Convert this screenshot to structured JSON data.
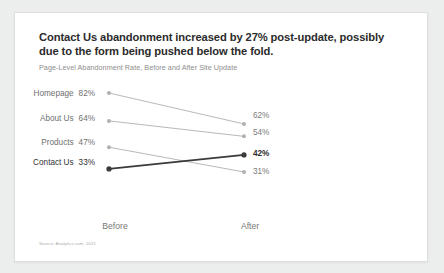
{
  "card": {
    "title": "Contact Us abandonment increased by 27% post-update, possibly due to the form being pushed below the fold.",
    "subtitle": "Page-Level Abandonment Rate, Before and After Site Update",
    "source": "Source: Analytics.com, 2021."
  },
  "axis": {
    "before_label": "Before",
    "after_label": "After"
  },
  "labels": {
    "homepage_name": "Homepage",
    "homepage_before": "82%",
    "homepage_after": "62%",
    "aboutus_name": "About Us",
    "aboutus_before": "64%",
    "aboutus_after": "54%",
    "products_name": "Products",
    "products_before": "47%",
    "products_after": "31%",
    "contactus_name": "Contact Us",
    "contactus_before": "33%",
    "contactus_after": "42%"
  },
  "colors": {
    "highlight": "#3a3a3a",
    "muted": "#b0b0b0",
    "card_bg": "#ffffff",
    "page_bg": "#eceded",
    "title": "#2b2b2b",
    "subtitle": "#8d8d8d"
  },
  "chart_data": {
    "type": "line",
    "subtype": "slope",
    "title": "Contact Us abandonment increased by 27% post-update, possibly due to the form being pushed below the fold.",
    "subtitle": "Page-Level Abandonment Rate, Before and After Site Update",
    "xlabel": "",
    "ylabel": "",
    "categories": [
      "Before",
      "After"
    ],
    "ylim": [
      0,
      100
    ],
    "grid": false,
    "legend": "none",
    "value_suffix": "%",
    "series": [
      {
        "name": "Homepage",
        "values": [
          82,
          62
        ],
        "highlight": false
      },
      {
        "name": "About Us",
        "values": [
          64,
          54
        ],
        "highlight": false
      },
      {
        "name": "Products",
        "values": [
          47,
          31
        ],
        "highlight": false
      },
      {
        "name": "Contact Us",
        "values": [
          33,
          42
        ],
        "highlight": true
      }
    ]
  }
}
